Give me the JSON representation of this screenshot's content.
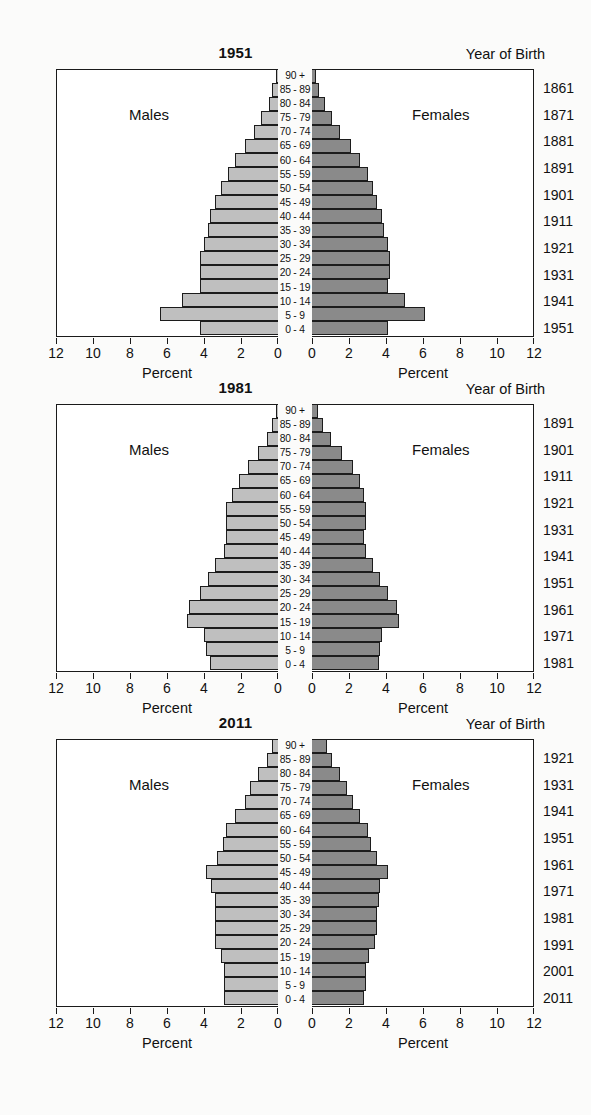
{
  "figure": {
    "yob_header": "Year of Birth",
    "axis_title": "Percent",
    "male_label": "Males",
    "female_label": "Females",
    "age_groups": [
      "90 +",
      "85 - 89",
      "80 - 84",
      "75 - 79",
      "70 - 74",
      "65 - 69",
      "60 - 64",
      "55 - 59",
      "50 - 54",
      "45 - 49",
      "40 - 44",
      "35 - 39",
      "30 - 34",
      "25 - 29",
      "20 - 24",
      "15 - 19",
      "10 - 14",
      "5 - 9",
      "0 - 4"
    ],
    "left_ticks": [
      "12",
      "10",
      "8",
      "6",
      "4",
      "2",
      "0"
    ],
    "right_ticks": [
      "0",
      "2",
      "4",
      "6",
      "8",
      "10",
      "12"
    ],
    "colors": {
      "male_fill": "#bfbfbf",
      "female_fill": "#8a8a8a",
      "outline": "#1c1c1c",
      "background": "#ffffff"
    }
  },
  "chart_data": [
    {
      "type": "bar",
      "title": "1951",
      "subtitle": "Population pyramid",
      "xlabel": "Percent",
      "ylabel": "Age group",
      "xlim": [
        0,
        12
      ],
      "grid": false,
      "legend": [
        "Males",
        "Females"
      ],
      "categories": [
        "90 +",
        "85 - 89",
        "80 - 84",
        "75 - 79",
        "70 - 74",
        "65 - 69",
        "60 - 64",
        "55 - 59",
        "50 - 54",
        "45 - 49",
        "40 - 44",
        "35 - 39",
        "30 - 34",
        "25 - 29",
        "20 - 24",
        "15 - 19",
        "10 - 14",
        "5 - 9",
        "0 - 4"
      ],
      "series": [
        {
          "name": "Males",
          "values": [
            0.1,
            0.3,
            0.5,
            0.9,
            1.3,
            1.8,
            2.3,
            2.7,
            3.1,
            3.4,
            3.7,
            3.8,
            4.0,
            4.2,
            4.2,
            4.2,
            5.2,
            6.4,
            4.2
          ]
        },
        {
          "name": "Females",
          "values": [
            0.2,
            0.4,
            0.7,
            1.1,
            1.5,
            2.1,
            2.6,
            3.0,
            3.3,
            3.5,
            3.8,
            3.9,
            4.1,
            4.2,
            4.2,
            4.1,
            5.0,
            6.1,
            4.1
          ]
        }
      ],
      "year_of_birth": [
        "1861",
        "1871",
        "1881",
        "1891",
        "1901",
        "1911",
        "1921",
        "1931",
        "1941",
        "1951"
      ]
    },
    {
      "type": "bar",
      "title": "1981",
      "subtitle": "Population pyramid",
      "xlabel": "Percent",
      "ylabel": "Age group",
      "xlim": [
        0,
        12
      ],
      "grid": false,
      "legend": [
        "Males",
        "Females"
      ],
      "categories": [
        "90 +",
        "85 - 89",
        "80 - 84",
        "75 - 79",
        "70 - 74",
        "65 - 69",
        "60 - 64",
        "55 - 59",
        "50 - 54",
        "45 - 49",
        "40 - 44",
        "35 - 39",
        "30 - 34",
        "25 - 29",
        "20 - 24",
        "15 - 19",
        "10 - 14",
        "5 - 9",
        "0 - 4"
      ],
      "series": [
        {
          "name": "Males",
          "values": [
            0.1,
            0.3,
            0.6,
            1.1,
            1.6,
            2.1,
            2.5,
            2.8,
            2.8,
            2.8,
            2.9,
            3.4,
            3.8,
            4.2,
            4.8,
            4.9,
            4.0,
            3.9,
            3.7
          ]
        },
        {
          "name": "Females",
          "values": [
            0.3,
            0.6,
            1.0,
            1.6,
            2.2,
            2.6,
            2.8,
            2.9,
            2.9,
            2.8,
            2.9,
            3.3,
            3.7,
            4.1,
            4.6,
            4.7,
            3.8,
            3.7,
            3.6
          ]
        }
      ],
      "year_of_birth": [
        "1891",
        "1901",
        "1911",
        "1921",
        "1931",
        "1941",
        "1951",
        "1961",
        "1971",
        "1981"
      ]
    },
    {
      "type": "bar",
      "title": "2011",
      "subtitle": "Population pyramid",
      "xlabel": "Percent",
      "ylabel": "Age group",
      "xlim": [
        0,
        12
      ],
      "grid": false,
      "legend": [
        "Males",
        "Females"
      ],
      "categories": [
        "90 +",
        "85 - 89",
        "80 - 84",
        "75 - 79",
        "70 - 74",
        "65 - 69",
        "60 - 64",
        "55 - 59",
        "50 - 54",
        "45 - 49",
        "40 - 44",
        "35 - 39",
        "30 - 34",
        "25 - 29",
        "20 - 24",
        "15 - 19",
        "10 - 14",
        "5 - 9",
        "0 - 4"
      ],
      "series": [
        {
          "name": "Males",
          "values": [
            0.3,
            0.6,
            1.1,
            1.5,
            1.8,
            2.3,
            2.8,
            3.0,
            3.3,
            3.9,
            3.6,
            3.4,
            3.4,
            3.4,
            3.4,
            3.1,
            2.9,
            2.9,
            2.9
          ]
        },
        {
          "name": "Females",
          "values": [
            0.8,
            1.1,
            1.5,
            1.9,
            2.2,
            2.6,
            3.0,
            3.2,
            3.5,
            4.1,
            3.7,
            3.6,
            3.5,
            3.5,
            3.4,
            3.1,
            2.9,
            2.9,
            2.8
          ]
        }
      ],
      "year_of_birth": [
        "1921",
        "1931",
        "1941",
        "1951",
        "1961",
        "1971",
        "1981",
        "1991",
        "2001",
        "2011"
      ]
    }
  ]
}
